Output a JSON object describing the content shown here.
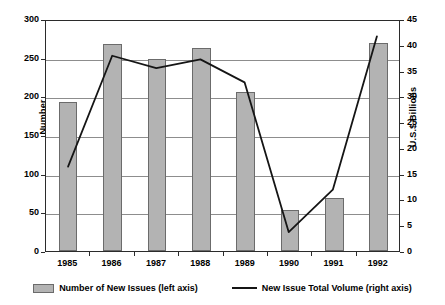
{
  "chart_data": {
    "type": "bar",
    "title": "",
    "subtitle": "",
    "xlabel": "",
    "ylabel": "Number",
    "y2label": "U.S.$ Billions",
    "categories": [
      "1985",
      "1986",
      "1987",
      "1988",
      "1989",
      "1990",
      "1991",
      "1992"
    ],
    "ylim": [
      0,
      300
    ],
    "y2lim": [
      0,
      45
    ],
    "yticks": [
      0,
      50,
      100,
      150,
      200,
      250,
      300
    ],
    "y2ticks": [
      0,
      5,
      10,
      15,
      20,
      25,
      30,
      35,
      40,
      45
    ],
    "grid": true,
    "legend_position": "bottom",
    "series": [
      {
        "name": "Number of New Issues (left axis)",
        "type": "bar",
        "axis": "left",
        "color": "#b3b3b3",
        "values": [
          193,
          268,
          248,
          263,
          206,
          53,
          69,
          269
        ]
      },
      {
        "name": "New Issue Total Volume (right axis)",
        "type": "line",
        "axis": "right",
        "color": "#151515",
        "values": [
          16.5,
          38.2,
          35.8,
          37.5,
          33.0,
          3.7,
          12.0,
          42.0
        ]
      }
    ]
  },
  "axes": {
    "left": {
      "title": "Number",
      "ticks": [
        "300",
        "250",
        "200",
        "150",
        "100",
        "50",
        "0"
      ]
    },
    "right": {
      "title": "U.S.$ Billions",
      "ticks": [
        "45",
        "40",
        "35",
        "30",
        "25",
        "20",
        "15",
        "10",
        "5",
        "0"
      ]
    },
    "bottom": {
      "ticks": [
        "1985",
        "1986",
        "1987",
        "1988",
        "1989",
        "1990",
        "1991",
        "1992"
      ]
    }
  },
  "legend": {
    "items": [
      {
        "label": "Number of New Issues (left axis)",
        "marker": "bar-swatch"
      },
      {
        "label": "New Issue Total Volume (right axis)",
        "marker": "line-swatch"
      }
    ]
  },
  "colors": {
    "bar_fill": "#b3b3b3",
    "bar_border": "#6b6b6b",
    "line": "#151515",
    "grid": "#8d8d8d",
    "frame": "#2b2b2b",
    "background": "#ffffff"
  }
}
